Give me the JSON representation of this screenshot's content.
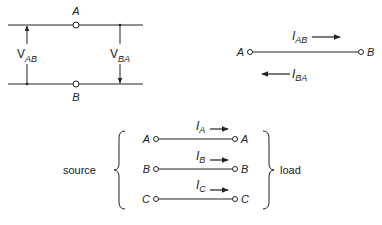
{
  "voltage_diagram": {
    "node_top": "A",
    "node_bottom": "B",
    "left_label": {
      "main": "V",
      "sub": "AB"
    },
    "right_label": {
      "main": "V",
      "sub": "BA"
    }
  },
  "current_diagram": {
    "node_left": "A",
    "node_right": "B",
    "top_label": {
      "main": "I",
      "sub": "AB"
    },
    "bottom_label": {
      "main": "I",
      "sub": "BA"
    }
  },
  "three_phase": {
    "source_label": "source",
    "load_label": "load",
    "lines": [
      {
        "from": "A",
        "to": "A",
        "current": {
          "main": "I",
          "sub": "A"
        }
      },
      {
        "from": "B",
        "to": "B",
        "current": {
          "main": "I",
          "sub": "B"
        }
      },
      {
        "from": "C",
        "to": "C",
        "current": {
          "main": "I",
          "sub": "C"
        }
      }
    ]
  },
  "colors": {
    "ink": "#222222",
    "background": "#ffffff"
  }
}
